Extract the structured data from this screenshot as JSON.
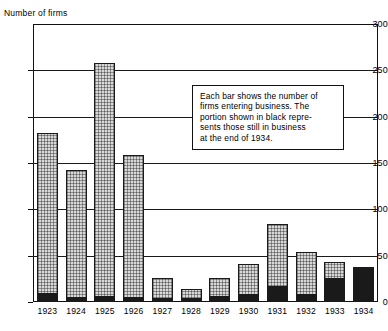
{
  "chart_data": {
    "type": "bar",
    "title": "",
    "ylabel": "Number of firms",
    "xlabel": "",
    "ylim": [
      0,
      300
    ],
    "yticks": [
      0,
      50,
      100,
      150,
      200,
      250,
      300
    ],
    "grid": true,
    "legend": null,
    "categories": [
      "1923",
      "1924",
      "1925",
      "1926",
      "1927",
      "1928",
      "1929",
      "1930",
      "1931",
      "1932",
      "1933",
      "1934"
    ],
    "series": [
      {
        "name": "Firms entering business",
        "values": [
          182,
          143,
          258,
          159,
          26,
          14,
          26,
          41,
          84,
          54,
          43,
          38
        ]
      },
      {
        "name": "Still in business at end of 1934",
        "values": [
          10,
          5,
          6,
          5,
          4,
          4,
          6,
          9,
          17,
          9,
          26,
          38
        ]
      }
    ],
    "annotation": {
      "lines": [
        "Each bar shows the number of",
        "firms entering business. The",
        "portion shown in black repre-",
        "sents those still in business",
        "at the end of 1934."
      ]
    }
  }
}
